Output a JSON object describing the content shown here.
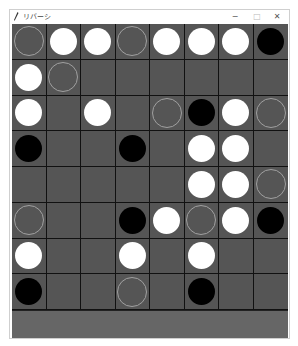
{
  "window": {
    "title": "リバーシ",
    "controls": {
      "minimize": "−",
      "maximize": "□",
      "close": "✕"
    }
  },
  "board": {
    "size": 8,
    "legend": {
      "W": "white stone",
      "B": "black stone",
      "H": "valid move hint",
      "_": "empty"
    },
    "colors": {
      "board": "#555555",
      "grid": "#111111",
      "white": "#ffffff",
      "black": "#000000",
      "hint": "#a0a0a0"
    },
    "rows": [
      [
        "H",
        "W",
        "W",
        "H",
        "W",
        "W",
        "W",
        "B"
      ],
      [
        "W",
        "H",
        "_",
        "_",
        "_",
        "_",
        "_",
        "_"
      ],
      [
        "W",
        "_",
        "W",
        "_",
        "H",
        "B",
        "W",
        "H"
      ],
      [
        "B",
        "_",
        "_",
        "B",
        "_",
        "W",
        "W",
        "_"
      ],
      [
        "_",
        "_",
        "_",
        "_",
        "_",
        "W",
        "W",
        "H"
      ],
      [
        "H",
        "_",
        "_",
        "B",
        "W",
        "H",
        "W",
        "B"
      ],
      [
        "W",
        "_",
        "_",
        "W",
        "_",
        "W",
        "_",
        "_"
      ],
      [
        "B",
        "_",
        "_",
        "H",
        "_",
        "B",
        "_",
        "_"
      ]
    ]
  },
  "status": {
    "text": ""
  }
}
